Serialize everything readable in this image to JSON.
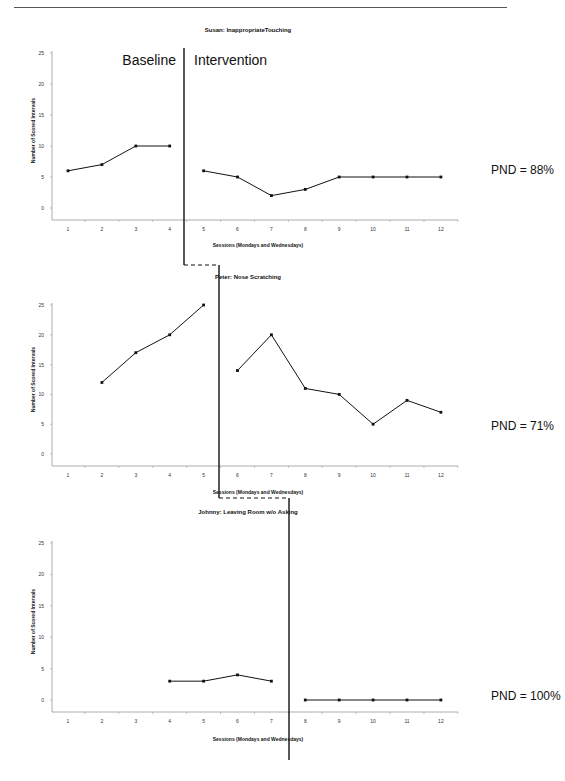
{
  "figure": {
    "phase_labels": {
      "baseline": "Baseline",
      "intervention": "Intervention"
    }
  },
  "chart_data": [
    {
      "type": "line",
      "title": "Susan: InappropriateTouching",
      "xlabel": "Sessions (Mondays and Wednesdays)",
      "ylabel": "Number of Scored Intervals",
      "ylim": [
        0,
        25
      ],
      "yticks": [
        0,
        5,
        10,
        15,
        20,
        25
      ],
      "categories": [
        1,
        2,
        3,
        4,
        5,
        6,
        7,
        8,
        9,
        10,
        11,
        12
      ],
      "grid": false,
      "phase_change_after_session": 4,
      "series": [
        {
          "name": "Baseline",
          "x": [
            1,
            2,
            3,
            4
          ],
          "values": [
            6,
            7,
            10,
            10
          ]
        },
        {
          "name": "Intervention",
          "x": [
            5,
            6,
            7,
            8,
            9,
            10,
            11,
            12
          ],
          "values": [
            6,
            5,
            2,
            3,
            5,
            5,
            5,
            5
          ]
        }
      ],
      "annotation": "PND = 88%"
    },
    {
      "type": "line",
      "title": "Peter: Nose Scratching",
      "xlabel": "Sessions (Mondays and Wednesdays)",
      "ylabel": "Number of Scored Intervals",
      "ylim": [
        0,
        25
      ],
      "yticks": [
        0,
        5,
        10,
        15,
        20,
        25
      ],
      "categories": [
        1,
        2,
        3,
        4,
        5,
        6,
        7,
        8,
        9,
        10,
        11,
        12
      ],
      "grid": false,
      "phase_change_after_session": 5,
      "series": [
        {
          "name": "Baseline",
          "x": [
            2,
            3,
            4,
            5
          ],
          "values": [
            12,
            17,
            20,
            25
          ]
        },
        {
          "name": "Intervention",
          "x": [
            6,
            7,
            8,
            9,
            10,
            11,
            12
          ],
          "values": [
            14,
            20,
            11,
            10,
            5,
            9,
            7
          ]
        }
      ],
      "annotation": "PND = 71%"
    },
    {
      "type": "line",
      "title": "Johnny: Leaving Room w/o Asking",
      "xlabel": "Sessions (Mondays and Wednesdays)",
      "ylabel": "Number of Scored Intervals",
      "ylim": [
        0,
        25
      ],
      "yticks": [
        0,
        5,
        10,
        15,
        20,
        25
      ],
      "categories": [
        1,
        2,
        3,
        4,
        5,
        6,
        7,
        8,
        9,
        10,
        11,
        12
      ],
      "grid": false,
      "phase_change_after_session": 7,
      "series": [
        {
          "name": "Baseline",
          "x": [
            4,
            5,
            6,
            7
          ],
          "values": [
            3,
            3,
            4,
            3
          ]
        },
        {
          "name": "Intervention",
          "x": [
            8,
            9,
            10,
            11,
            12
          ],
          "values": [
            0,
            0,
            0,
            0,
            0
          ]
        }
      ],
      "annotation": "PND = 100%"
    }
  ]
}
